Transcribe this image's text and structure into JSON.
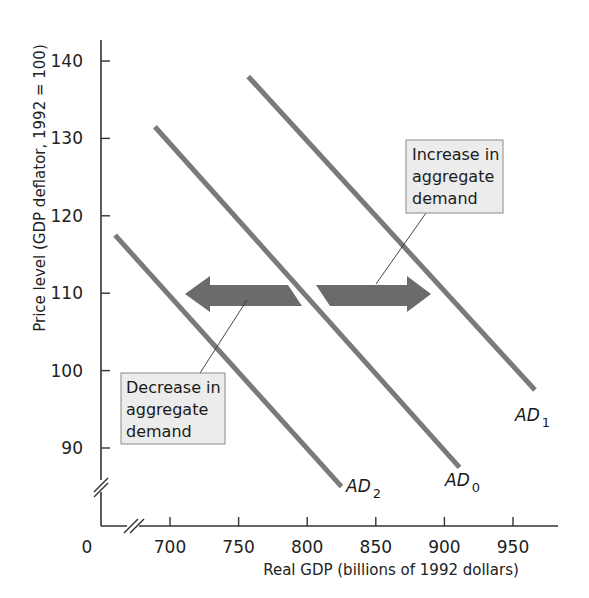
{
  "chart_data": {
    "type": "line",
    "title": "",
    "xlabel": "Real GDP (billions of 1992 dollars)",
    "ylabel": "Price level (GDP deflator, 1992 = 100)",
    "origin_label": "0",
    "x_ticks": [
      700,
      750,
      800,
      850,
      900,
      950
    ],
    "y_ticks": [
      90,
      100,
      110,
      120,
      130,
      140
    ],
    "xlim": [
      650,
      985
    ],
    "ylim": [
      80,
      145
    ],
    "axis_breaks": [
      "x",
      "y"
    ],
    "grid": false,
    "series": [
      {
        "name": "AD0",
        "label_main": "AD",
        "label_sub": "0",
        "points": [
          [
            689,
            131.5
          ],
          [
            911,
            87.5
          ]
        ]
      },
      {
        "name": "AD1",
        "label_main": "AD",
        "label_sub": "1",
        "points": [
          [
            757,
            138
          ],
          [
            966,
            97.5
          ]
        ]
      },
      {
        "name": "AD2",
        "label_main": "AD",
        "label_sub": "2",
        "points": [
          [
            660,
            117.5
          ],
          [
            825,
            85
          ]
        ]
      }
    ],
    "annotations": [
      {
        "id": "increase",
        "lines": [
          "Increase in",
          "aggregate",
          "demand"
        ],
        "arrow": "right",
        "arrow_y": 110,
        "arrow_x": [
          795,
          892
        ]
      },
      {
        "id": "decrease",
        "lines": [
          "Decrease in",
          "aggregate",
          "demand"
        ],
        "arrow": "left",
        "arrow_y": 110,
        "arrow_x": [
          711,
          790
        ]
      }
    ]
  },
  "colors": {
    "curve": "#7a7a7a",
    "arrow": "#6b6b6b",
    "axis": "#333333",
    "box_fill": "#ececec",
    "box_stroke": "#8a8a8a"
  }
}
